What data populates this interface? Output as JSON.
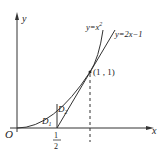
{
  "diagram": {
    "axes": {
      "x_label": "x",
      "y_label": "y",
      "origin_label": "O"
    },
    "curves": [
      {
        "name": "parabola",
        "label_prefix": "y=x",
        "label_exp": "2",
        "equation": "y=x^2"
      },
      {
        "name": "tangent-line",
        "label": "y=2x−1",
        "equation": "y=2x-1"
      }
    ],
    "points": {
      "intersection": "(1 , 1)"
    },
    "regions": {
      "d1_main": "D",
      "d1_sub": "1",
      "d2_main": "D",
      "d2_sub": "2"
    },
    "ticks": {
      "half_num": "1",
      "half_den": "2"
    },
    "colors": {
      "stroke": "#222222",
      "background": "#ffffff"
    }
  }
}
